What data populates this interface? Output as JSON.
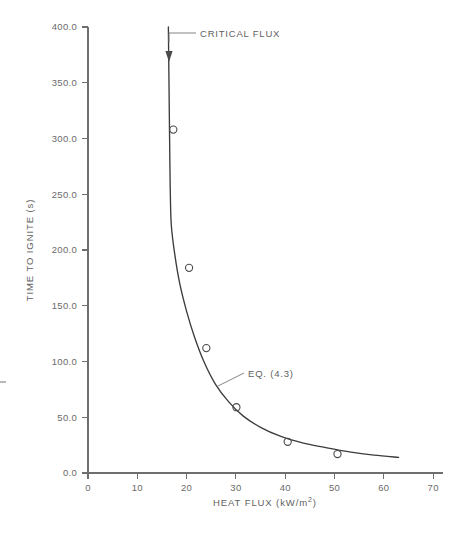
{
  "chart_data": {
    "type": "scatter",
    "title": "",
    "subtitle": "",
    "xlabel": "HEAT FLUX (kW/m2)",
    "xlabel_base": "HEAT FLUX (kW/m",
    "xlabel_sup": "2",
    "xlabel_tail": ")",
    "ylabel": "TIME TO IGNITE (s)",
    "xlim": [
      0,
      72
    ],
    "ylim": [
      0,
      400
    ],
    "xticks": [
      0,
      10,
      20,
      30,
      40,
      50,
      60,
      70
    ],
    "xticklabels": [
      "0",
      "10",
      "20",
      "30",
      "40",
      "50",
      "60",
      "70"
    ],
    "yticks": [
      0,
      50,
      100,
      150,
      200,
      250,
      300,
      350,
      400
    ],
    "yticklabels": [
      "0.0",
      "50.0",
      "100.0",
      "150.0",
      "200.0",
      "250.0",
      "300.0",
      "350.0",
      "400.0"
    ],
    "grid": false,
    "legend": "none",
    "series": [
      {
        "name": "Experimental data",
        "type": "scatter",
        "marker": "open-circle",
        "color": "#4a4a4a",
        "points": [
          {
            "x": 17.3,
            "y": 308
          },
          {
            "x": 20.5,
            "y": 184
          },
          {
            "x": 24.0,
            "y": 112
          },
          {
            "x": 30.1,
            "y": 59
          },
          {
            "x": 40.5,
            "y": 28
          },
          {
            "x": 50.6,
            "y": 17
          }
        ]
      },
      {
        "name": "EQ. (4.3)",
        "type": "line",
        "color": "#3c3c3c",
        "points": [
          {
            "x": 16.3,
            "y": 400
          },
          {
            "x": 16.4,
            "y": 360
          },
          {
            "x": 16.5,
            "y": 320
          },
          {
            "x": 16.6,
            "y": 280
          },
          {
            "x": 16.7,
            "y": 250
          },
          {
            "x": 16.9,
            "y": 222
          },
          {
            "x": 17.6,
            "y": 196
          },
          {
            "x": 18.6,
            "y": 170
          },
          {
            "x": 20.0,
            "y": 145
          },
          {
            "x": 21.6,
            "y": 122
          },
          {
            "x": 23.5,
            "y": 100
          },
          {
            "x": 25.8,
            "y": 80
          },
          {
            "x": 28.5,
            "y": 64
          },
          {
            "x": 31.5,
            "y": 51
          },
          {
            "x": 35.0,
            "y": 41
          },
          {
            "x": 39.0,
            "y": 33
          },
          {
            "x": 43.5,
            "y": 27
          },
          {
            "x": 48.0,
            "y": 23
          },
          {
            "x": 53.0,
            "y": 19
          },
          {
            "x": 58.0,
            "y": 16
          },
          {
            "x": 63.0,
            "y": 14
          }
        ]
      }
    ],
    "annotations": [
      {
        "label": "CRITICAL FLUX",
        "text_x": 200,
        "text_y": 40,
        "target_x": 16.4,
        "target_y": 368,
        "arrow": "down"
      },
      {
        "label": "EQ. (4.3)",
        "text_x": 248,
        "text_y": 377,
        "target_x": 26.0,
        "target_y": 78,
        "arrow": "none"
      }
    ],
    "colors": {
      "axis": "#6e6e6e",
      "curve": "#3c3c3c",
      "marker": "#4a4a4a",
      "text": "#5f5f5f",
      "background": "#ffffff"
    }
  }
}
